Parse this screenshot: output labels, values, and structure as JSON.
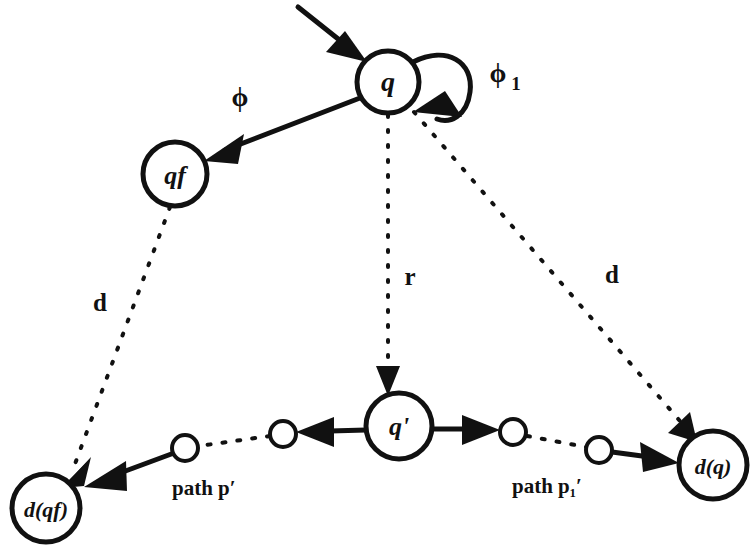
{
  "diagram": {
    "background_color": "#ffffff",
    "stroke_color": "#111111",
    "nodes": [
      {
        "id": "q",
        "label": "q",
        "cx": 388,
        "cy": 82,
        "r": 31,
        "font_size": 28,
        "italic": true
      },
      {
        "id": "qf",
        "label": "qf",
        "cx": 175,
        "cy": 174,
        "r": 32,
        "font_size": 26,
        "italic": true
      },
      {
        "id": "qp",
        "label": "q'",
        "cx": 399,
        "cy": 426,
        "r": 33,
        "font_size": 26,
        "italic": true
      },
      {
        "id": "dqf",
        "label": "d(qf)",
        "cx": 46,
        "cy": 508,
        "r": 34,
        "font_size": 22,
        "italic": true
      },
      {
        "id": "dq",
        "label": "d(q)",
        "cx": 713,
        "cy": 465,
        "r": 34,
        "font_size": 22,
        "italic": true
      }
    ],
    "small_nodes": [
      {
        "id": "p1",
        "cx": 185,
        "cy": 448,
        "r": 13
      },
      {
        "id": "p2",
        "cx": 283,
        "cy": 434,
        "r": 13
      },
      {
        "id": "p3",
        "cx": 513,
        "cy": 432,
        "r": 13
      },
      {
        "id": "p4",
        "cx": 599,
        "cy": 450,
        "r": 13
      }
    ],
    "edge_labels": [
      {
        "id": "phi",
        "text": "ϕ",
        "sub": "",
        "x": 240,
        "y": 100,
        "font_size": 26
      },
      {
        "id": "phi1",
        "text": "ϕ",
        "sub": "1",
        "x": 500,
        "y": 76,
        "font_size": 26
      },
      {
        "id": "d_left",
        "text": "d",
        "sub": "",
        "x": 100,
        "y": 305,
        "font_size": 24
      },
      {
        "id": "r_mid",
        "text": "r",
        "sub": "",
        "x": 410,
        "y": 279,
        "font_size": 24
      },
      {
        "id": "d_right",
        "text": "d",
        "sub": "",
        "x": 612,
        "y": 277,
        "font_size": 24
      }
    ],
    "path_labels": [
      {
        "id": "path_p_prime",
        "text": "path p′",
        "x": 172,
        "y": 490,
        "font_size": 21
      },
      {
        "id": "path_p1_prime",
        "text": "path p₁′",
        "x": 512,
        "y": 488,
        "font_size": 21
      }
    ],
    "edges": [
      {
        "id": "start-arrow",
        "kind": "solid",
        "from": "start",
        "to": "q"
      },
      {
        "id": "q-to-qf",
        "kind": "solid",
        "from": "q",
        "to": "qf",
        "label": "phi"
      },
      {
        "id": "q-self-loop",
        "kind": "solid",
        "from": "q",
        "to": "q",
        "label": "phi1"
      },
      {
        "id": "qf-to-dqf",
        "kind": "dashed",
        "from": "qf",
        "to": "dqf",
        "label": "d_left"
      },
      {
        "id": "q-to-qprime",
        "kind": "dashed",
        "from": "q",
        "to": "qp",
        "label": "r_mid"
      },
      {
        "id": "q-to-dq",
        "kind": "dashed",
        "from": "q",
        "to": "dq",
        "label": "d_right"
      },
      {
        "id": "qprime-to-p2",
        "kind": "solid",
        "from": "qp",
        "to": "p2"
      },
      {
        "id": "p2-to-p1",
        "kind": "dashed",
        "from": "p2",
        "to": "p1"
      },
      {
        "id": "p1-to-dqf",
        "kind": "solid",
        "from": "p1",
        "to": "dqf"
      },
      {
        "id": "qprime-to-p3",
        "kind": "solid",
        "from": "qp",
        "to": "p3"
      },
      {
        "id": "p3-to-p4",
        "kind": "dashed",
        "from": "p3",
        "to": "p4"
      },
      {
        "id": "p4-to-dq",
        "kind": "solid",
        "from": "p4",
        "to": "dq"
      }
    ]
  }
}
